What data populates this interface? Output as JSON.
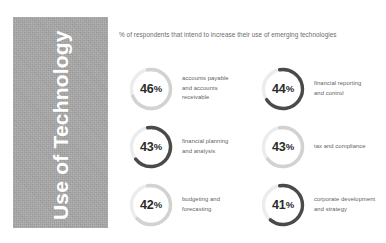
{
  "panel": {
    "title": "Use of Technology",
    "bg_color": "#a8a8a8",
    "text_color": "#ffffff"
  },
  "header": {
    "text": "% of respondents that intend to increase their use of emerging technologies"
  },
  "colors": {
    "track": "#ececec",
    "arc_light": "#d2d2d2",
    "arc_dark": "#4a4a4a",
    "value_text": "#2b2b2b",
    "label_text": "#5f5f5f"
  },
  "chart_data": {
    "type": "pie",
    "title": "% of respondents that intend to increase their use of emerging technologies",
    "xlabel": "",
    "ylabel": "",
    "categories": [
      "accounts payable and accounts receivable",
      "financial reporting and control",
      "financial planning and analysis",
      "tax and compliance",
      "budgeting and forecasting",
      "corporate development and strategy"
    ],
    "values": [
      46,
      44,
      43,
      43,
      42,
      41
    ],
    "unit": "%",
    "legend": "none",
    "grid": false
  },
  "stats": [
    {
      "value": "46",
      "pct": "%",
      "percent": 46,
      "arc_tone": "light",
      "label_lines": [
        "accounts payable",
        "and accounts",
        "receivable"
      ]
    },
    {
      "value": "44",
      "pct": "%",
      "percent": 44,
      "arc_tone": "dark",
      "label_lines": [
        "financial reporting",
        "and control"
      ]
    },
    {
      "value": "43",
      "pct": "%",
      "percent": 43,
      "arc_tone": "dark",
      "label_lines": [
        "financial planning",
        "and analysis"
      ]
    },
    {
      "value": "43",
      "pct": "%",
      "percent": 43,
      "arc_tone": "light",
      "label_lines": [
        "tax and compliance"
      ]
    },
    {
      "value": "42",
      "pct": "%",
      "percent": 42,
      "arc_tone": "light",
      "label_lines": [
        "budgeting and",
        "forecasting"
      ]
    },
    {
      "value": "41",
      "pct": "%",
      "percent": 41,
      "arc_tone": "dark",
      "label_lines": [
        "corporate development",
        "and strategy"
      ]
    }
  ]
}
